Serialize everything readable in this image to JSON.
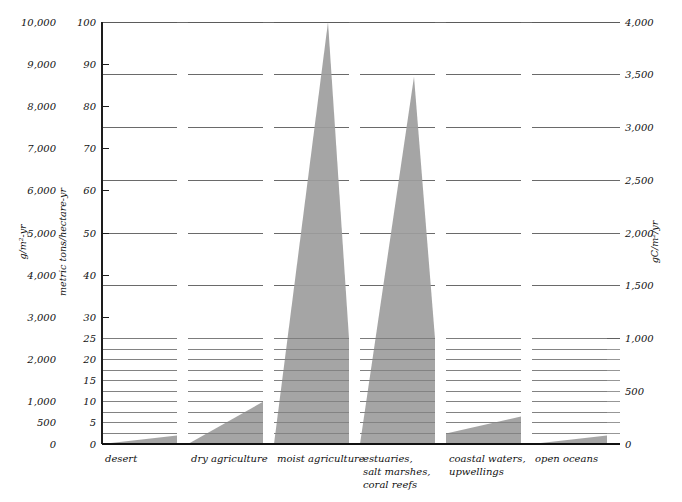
{
  "chart_data": {
    "type": "area",
    "title": "",
    "subtitle": "",
    "categories": [
      "desert",
      "dry agriculture",
      "moist agriculture",
      "estuaries,\nsalt marshes,\ncoral reefs",
      "coastal waters,\nupwellings",
      "open oceans"
    ],
    "series": [
      {
        "name": "net primary productivity range",
        "units": "metric tons/hectare-yr",
        "ranges": [
          {
            "category": "desert",
            "low": 0,
            "high": 2
          },
          {
            "category": "dry agriculture",
            "low": 0,
            "high": 10
          },
          {
            "category": "moist agriculture",
            "low": 10,
            "high": 100
          },
          {
            "category": "estuaries, salt marshes, coral reefs",
            "low": 0,
            "high": 87
          },
          {
            "category": "coastal waters, upwellings",
            "low": 2.5,
            "high": 6.5
          },
          {
            "category": "open oceans",
            "low": 0,
            "high": 2
          }
        ]
      }
    ],
    "axes": {
      "left_outer": {
        "label": "g/m²-yr",
        "ticks": [
          "0",
          "500",
          "1,000",
          "2,000",
          "3,000",
          "4,000",
          "5,000",
          "6,000",
          "7,000",
          "8,000",
          "9,000",
          "10,000"
        ],
        "range": [
          0,
          10000
        ]
      },
      "left_inner": {
        "label": "metric tons/hectare-yr",
        "ticks": [
          "0",
          "5",
          "10",
          "15",
          "20",
          "25",
          "30",
          "40",
          "50",
          "60",
          "70",
          "80",
          "90",
          "100"
        ],
        "range": [
          0,
          100
        ]
      },
      "right": {
        "label": "gC/m²/yr",
        "ticks": [
          "0",
          "500",
          "1,000",
          "1,500",
          "2,000",
          "2,500",
          "3,000",
          "3,500",
          "4,000"
        ],
        "range": [
          0,
          4000
        ]
      }
    },
    "gridlines": {
      "major_right_values": [
        1000,
        1500,
        2000,
        2500,
        3000,
        3500,
        4000
      ],
      "minor_right_step": 100,
      "minor_right_max": 1000,
      "position": "per-column-bands"
    },
    "legend": {
      "position": "none",
      "entries": []
    },
    "xlabel": "",
    "ylabel": "metric tons/hectare-yr",
    "ylim": [
      0,
      100
    ]
  },
  "axis_titles": {
    "left_outer": "g/m²-yr",
    "left_inner": "metric tons/hectare-yr",
    "right": "gC/m²/yr"
  },
  "left_outer_ticks": [
    {
      "label": "10,000",
      "value": 10000
    },
    {
      "label": "9,000",
      "value": 9000
    },
    {
      "label": "8,000",
      "value": 8000
    },
    {
      "label": "7,000",
      "value": 7000
    },
    {
      "label": "6,000",
      "value": 6000
    },
    {
      "label": "5,000",
      "value": 5000
    },
    {
      "label": "4,000",
      "value": 4000
    },
    {
      "label": "3,000",
      "value": 3000
    },
    {
      "label": "2,000",
      "value": 2000
    },
    {
      "label": "1,000",
      "value": 1000
    },
    {
      "label": "500",
      "value": 500
    },
    {
      "label": "0",
      "value": 0
    }
  ],
  "left_inner_ticks": [
    {
      "label": "100",
      "value": 100
    },
    {
      "label": "90",
      "value": 90
    },
    {
      "label": "80",
      "value": 80
    },
    {
      "label": "70",
      "value": 70
    },
    {
      "label": "60",
      "value": 60
    },
    {
      "label": "50",
      "value": 50
    },
    {
      "label": "40",
      "value": 40
    },
    {
      "label": "30",
      "value": 30
    },
    {
      "label": "25",
      "value": 25
    },
    {
      "label": "20",
      "value": 20
    },
    {
      "label": "15",
      "value": 15
    },
    {
      "label": "10",
      "value": 10
    },
    {
      "label": "5",
      "value": 5
    },
    {
      "label": "0",
      "value": 0
    }
  ],
  "right_ticks": [
    {
      "label": "4,000",
      "value": 4000
    },
    {
      "label": "3,500",
      "value": 3500
    },
    {
      "label": "3,000",
      "value": 3000
    },
    {
      "label": "2,500",
      "value": 2500
    },
    {
      "label": "2,000",
      "value": 2000
    },
    {
      "label": "1,500",
      "value": 1500
    },
    {
      "label": "1,000",
      "value": 1000
    },
    {
      "label": "500",
      "value": 500
    },
    {
      "label": "0",
      "value": 0
    }
  ],
  "categories": [
    {
      "id": "desert",
      "lines": [
        "desert"
      ]
    },
    {
      "id": "dry-agriculture",
      "lines": [
        "dry agriculture"
      ]
    },
    {
      "id": "moist-agriculture",
      "lines": [
        "moist agriculture"
      ]
    },
    {
      "id": "estuaries",
      "lines": [
        "estuaries,",
        "salt marshes,",
        "coral reefs"
      ]
    },
    {
      "id": "coastal-waters",
      "lines": [
        "coastal waters,",
        "upwellings"
      ]
    },
    {
      "id": "open-oceans",
      "lines": [
        "open oceans"
      ]
    }
  ],
  "colors": {
    "wedge_fill": "#9d9d9d",
    "gridline": "#5a5a5a",
    "axis": "#1d1d1d",
    "text": "#111111",
    "background": "#ffffff"
  }
}
